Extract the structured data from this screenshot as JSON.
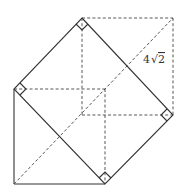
{
  "figure": {
    "type": "3D cuboid with inscribed square cross-section",
    "label": "4√2",
    "label_parts": {
      "coef": "4",
      "radical": "2"
    },
    "vertices": {
      "top": [
        82,
        18
      ],
      "left": [
        14,
        89
      ],
      "right": [
        173,
        115
      ],
      "bottom": [
        105,
        184
      ],
      "bottom_left": [
        14,
        184
      ],
      "top_right": [
        173,
        18
      ],
      "inner_back": [
        105,
        89
      ],
      "inner_front": [
        82,
        115
      ]
    },
    "right_angle_marks": 4
  }
}
